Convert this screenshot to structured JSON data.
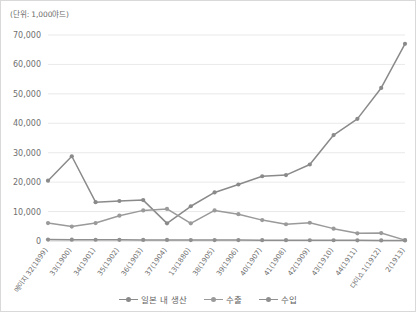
{
  "unit_label": "(단위: 1,000야드)",
  "legend": {
    "position": "bottom-center",
    "items": [
      {
        "label": "일본 내 생산",
        "color": "#8a8a8a",
        "icon": "line-marker-icon"
      },
      {
        "label": "수출",
        "color": "#9a9a9a",
        "icon": "line-marker-icon"
      },
      {
        "label": "수입",
        "color": "#8f8f8f",
        "icon": "line-marker-icon"
      }
    ]
  },
  "chart_data": {
    "type": "line",
    "title": "",
    "subtitle": "",
    "xlabel": "",
    "ylabel": "(단위: 1,000야드)",
    "grid": true,
    "ylim": [
      0,
      70000
    ],
    "yticks": [
      0,
      10000,
      20000,
      30000,
      40000,
      50000,
      60000,
      70000
    ],
    "ytick_labels": [
      "0",
      "10,000",
      "20,000",
      "30,000",
      "40,000",
      "50,000",
      "60,000",
      "70,000"
    ],
    "categories": [
      "메이지 32(1899)",
      "33(1900)",
      "34(1901)",
      "35(1902)",
      "36(1903)",
      "37(1904)",
      "13(1880)",
      "38(1905)",
      "39(1906)",
      "40(1907)",
      "41(1908)",
      "42(1909)",
      "43(1910)",
      "44(1911)",
      "다이쇼 1(1912)",
      "2(1913)"
    ],
    "series": [
      {
        "name": "일본 내 생산",
        "color": "#8a8a8a",
        "values": [
          20500,
          28800,
          13200,
          13600,
          13900,
          6000,
          11800,
          16500,
          19200,
          22000,
          22400,
          26000,
          36000,
          41500,
          52000,
          67000
        ]
      },
      {
        "name": "수출",
        "color": "#9a9a9a",
        "values": [
          6100,
          4900,
          6100,
          8600,
          10400,
          10900,
          6000,
          10400,
          9100,
          7100,
          5700,
          6200,
          4200,
          2600,
          2700,
          300
        ]
      },
      {
        "name": "수입",
        "color": "#8f8f8f",
        "values": [
          500,
          450,
          420,
          400,
          380,
          350,
          330,
          320,
          300,
          290,
          280,
          260,
          250,
          230,
          200,
          180
        ]
      }
    ]
  }
}
